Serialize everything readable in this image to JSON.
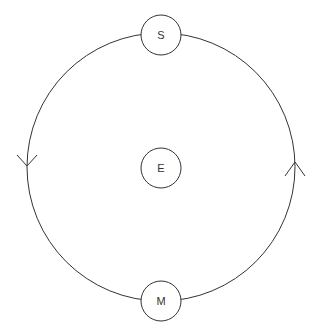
{
  "diagram": {
    "type": "orbit",
    "canvas": {
      "width": 319,
      "height": 336,
      "background": "#ffffff"
    },
    "stroke_color": "#333333",
    "orbit": {
      "center": [
        161,
        167
      ],
      "radius": 134,
      "direction": "counter-clockwise",
      "arrows": [
        {
          "position": "left",
          "points": "down",
          "tip": [
            27,
            165
          ]
        },
        {
          "position": "right",
          "points": "up",
          "tip": [
            295,
            162
          ]
        }
      ]
    },
    "bodies": [
      {
        "id": "S",
        "label": "S",
        "center": [
          161,
          35
        ],
        "radius": 20,
        "role": "on-orbit-top"
      },
      {
        "id": "E",
        "label": "E",
        "center": [
          161,
          168
        ],
        "radius": 20,
        "role": "center"
      },
      {
        "id": "M",
        "label": "M",
        "center": [
          161,
          301
        ],
        "radius": 20,
        "role": "on-orbit-bottom"
      }
    ]
  }
}
